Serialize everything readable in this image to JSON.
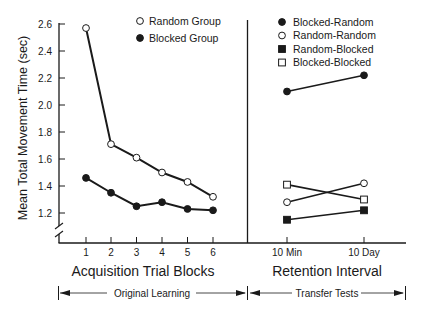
{
  "chart_data": [
    {
      "panel": "left",
      "type": "line",
      "title": "",
      "xlabel": "Acquisition Trial Blocks",
      "ylabel": "Mean Total Movement Time (sec)",
      "categories": [
        "1",
        "2",
        "3",
        "4",
        "5",
        "6"
      ],
      "yticks": [
        "1.2",
        "1.4",
        "1.6",
        "1.8",
        "2.0",
        "2.2",
        "2.4",
        "2.6"
      ],
      "ylim": [
        1.1,
        2.6
      ],
      "y_axis_break": true,
      "grid": false,
      "legend_position": "top-right of panel",
      "series": [
        {
          "name": "Random Group",
          "marker": "open-circle",
          "values": [
            2.57,
            1.71,
            1.61,
            1.5,
            1.43,
            1.32
          ]
        },
        {
          "name": "Blocked Group",
          "marker": "filled-circle",
          "values": [
            1.46,
            1.35,
            1.25,
            1.28,
            1.23,
            1.22
          ]
        }
      ],
      "bracket_label": "Original Learning"
    },
    {
      "panel": "right",
      "type": "line",
      "title": "",
      "xlabel": "Retention Interval",
      "categories": [
        "10 Min",
        "10 Day"
      ],
      "ylim": [
        1.1,
        2.6
      ],
      "grid": false,
      "legend_position": "top of panel",
      "series": [
        {
          "name": "Blocked-Random",
          "marker": "filled-circle",
          "values": [
            2.1,
            2.22
          ]
        },
        {
          "name": "Random-Random",
          "marker": "open-circle",
          "values": [
            1.28,
            1.42
          ]
        },
        {
          "name": "Random-Blocked",
          "marker": "filled-square",
          "values": [
            1.15,
            1.22
          ]
        },
        {
          "name": "Blocked-Blocked",
          "marker": "open-square",
          "values": [
            1.41,
            1.3
          ]
        }
      ],
      "bracket_label": "Transfer Tests"
    }
  ],
  "colors": {
    "ink": "#1a1a1a",
    "background": "#ffffff"
  }
}
